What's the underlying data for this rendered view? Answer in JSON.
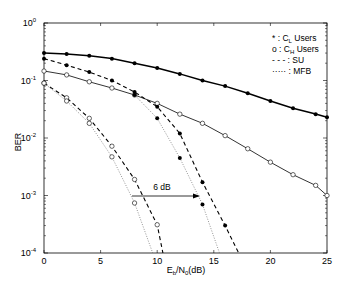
{
  "chart_data": {
    "type": "line",
    "title": "",
    "xlabel": "E_b/N_0(dB)",
    "ylabel": "BER",
    "xscale": "linear",
    "yscale": "log",
    "xlim": [
      0,
      25
    ],
    "ylim": [
      0.0001,
      1
    ],
    "xticks": [
      0,
      5,
      10,
      15,
      20,
      25
    ],
    "xtick_labels": [
      "0",
      "5",
      "10",
      "15",
      "20",
      "25"
    ],
    "yticks": [
      1,
      0.1,
      0.01,
      0.001,
      0.0001
    ],
    "ytick_labels": [
      "10^0",
      "10^-1",
      "10^-2",
      "10^-3",
      "10^-4"
    ],
    "grid": false,
    "legend": {
      "position": "upper right",
      "entries": [
        {
          "symbol": "*",
          "label": "C_L Users"
        },
        {
          "symbol": "o",
          "label": "C_H Users"
        },
        {
          "symbol": "---",
          "label": "SU"
        },
        {
          "symbol": "·····",
          "label": "MFB"
        }
      ]
    },
    "annotations": [
      {
        "type": "arrow",
        "text": "6 dB",
        "from": [
          7.8,
          0.0011
        ],
        "to": [
          13.8,
          0.0011
        ]
      }
    ],
    "series": [
      {
        "name": "C_L Users (proposed)",
        "line": "solid-thick",
        "marker": "filled",
        "x": [
          0,
          2,
          4,
          6,
          8,
          10,
          12,
          14,
          16,
          18,
          20,
          22,
          24,
          25
        ],
        "y": [
          0.3,
          0.29,
          0.27,
          0.24,
          0.2,
          0.165,
          0.13,
          0.1,
          0.08,
          0.06,
          0.044,
          0.033,
          0.026,
          0.023
        ]
      },
      {
        "name": "C_H Users (proposed)",
        "line": "solid-thin",
        "marker": "open",
        "x": [
          0,
          2,
          4,
          6,
          8,
          10,
          12,
          14,
          16,
          18,
          20,
          22,
          24,
          25
        ],
        "y": [
          0.146,
          0.125,
          0.095,
          0.074,
          0.056,
          0.04,
          0.026,
          0.018,
          0.011,
          0.0065,
          0.0038,
          0.0023,
          0.0015,
          0.001
        ]
      },
      {
        "name": "C_L Users SU",
        "line": "dashed",
        "marker": "filled",
        "x": [
          0,
          2,
          4,
          6,
          8,
          10,
          12,
          14,
          16,
          17.2
        ],
        "y": [
          0.24,
          0.185,
          0.14,
          0.1,
          0.063,
          0.035,
          0.012,
          0.0017,
          0.0003,
          0.0001
        ]
      },
      {
        "name": "C_L Users MFB",
        "line": "dotted",
        "marker": "filled",
        "x": [
          8,
          10,
          12,
          14,
          15.5
        ],
        "y": [
          0.056,
          0.022,
          0.0045,
          0.0007,
          0.0001
        ]
      },
      {
        "name": "C_H Users SU",
        "line": "dashed",
        "marker": "open",
        "x": [
          0,
          2,
          4,
          6,
          8,
          10,
          10.5
        ],
        "y": [
          0.09,
          0.05,
          0.022,
          0.0072,
          0.0019,
          0.00031,
          0.0001
        ]
      },
      {
        "name": "C_H Users MFB",
        "line": "dotted",
        "marker": "open",
        "x": [
          0,
          2,
          4,
          6,
          8,
          9.6
        ],
        "y": [
          0.09,
          0.044,
          0.018,
          0.0047,
          0.00074,
          0.0001
        ]
      }
    ]
  },
  "labels": {
    "ylabel": "BER",
    "xlabel_main": "E",
    "xlabel_sub1": "b",
    "xlabel_mid": "/N",
    "xlabel_sub2": "0",
    "xlabel_tail": "(dB)",
    "annotation": "6 dB",
    "legend": [
      {
        "sym": "* : C",
        "sub": "L",
        "tail": " Users"
      },
      {
        "sym": "o : C",
        "sub": "H",
        "tail": " Users"
      },
      {
        "sym": "- - - : SU",
        "sub": "",
        "tail": ""
      },
      {
        "sym": "····· : MFB",
        "sub": "",
        "tail": ""
      }
    ]
  }
}
